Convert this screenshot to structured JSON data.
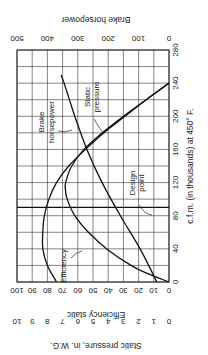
{
  "chart_data": {
    "type": "line",
    "orientation": "rotated-90",
    "title": "",
    "xlabel": "c.f.m. (in thousands) at 450° F.",
    "x_ticks": [
      0,
      40,
      80,
      120,
      160,
      200,
      240,
      280
    ],
    "xlim": [
      0,
      280
    ],
    "left_axes": [
      {
        "label": "Efficiency static",
        "ticks": [
          0,
          10,
          20,
          30,
          40,
          50,
          60,
          70,
          80,
          90,
          100
        ],
        "range": [
          0,
          100
        ]
      },
      {
        "label": "Static pressure, in. W.G.",
        "ticks": [
          0,
          1,
          2,
          3,
          4,
          5,
          6,
          7,
          8,
          9,
          10
        ],
        "range": [
          0,
          10
        ]
      }
    ],
    "right_axis": {
      "label": "Brake horsepower",
      "ticks": [
        0,
        100,
        200,
        300,
        400,
        500
      ],
      "range": [
        0,
        500
      ]
    },
    "grid": true,
    "series": [
      {
        "name": "Static pressure",
        "axis": "static_pressure_x10",
        "x": [
          0,
          20,
          40,
          60,
          80,
          100,
          120,
          140,
          160,
          180,
          200,
          220,
          240
        ],
        "values": [
          74,
          80,
          83,
          83,
          82,
          79,
          74,
          66,
          55,
          43,
          29,
          15,
          0
        ]
      },
      {
        "name": "Efficiency",
        "axis": "efficiency",
        "x": [
          0,
          10,
          20,
          40,
          60,
          80,
          100,
          110,
          120,
          140,
          160,
          180,
          200,
          220,
          240
        ],
        "values": [
          0,
          14,
          25,
          41,
          53,
          62,
          67,
          68,
          68,
          64,
          56,
          44,
          30,
          15,
          0
        ]
      },
      {
        "name": "Brake horsepower",
        "axis": "bhp",
        "x": [
          0,
          40,
          80,
          120,
          160,
          200,
          240,
          250
        ],
        "values": [
          40,
          95,
          160,
          220,
          270,
          310,
          345,
          355
        ]
      }
    ],
    "annotations": [
      {
        "text": "Brake horsepower",
        "target": "Brake horsepower"
      },
      {
        "text": "Static pressure",
        "target": "Static pressure"
      },
      {
        "text": "Efficiency",
        "target": "Efficiency"
      },
      {
        "text": "Design point",
        "x": 90
      }
    ],
    "design_point_cfm": 90
  },
  "labels": {
    "xlabel": "c.f.m. (in thousands) at 450° F.",
    "eff_label": "Efficiency static",
    "sp_label": "Static pressure, in. W.G.",
    "bhp_label": "Brake horsepower",
    "ann_bhp_1": "Brake",
    "ann_bhp_2": "horsepower",
    "ann_sp_1": "Static",
    "ann_sp_2": "pressure",
    "ann_eff": "Efficiency",
    "ann_dp_1": "Design",
    "ann_dp_2": "point"
  }
}
